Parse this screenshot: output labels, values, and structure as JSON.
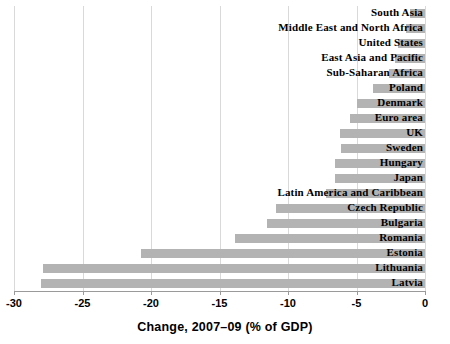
{
  "chart_data": {
    "type": "bar",
    "orientation": "horizontal",
    "title": "",
    "xlabel": "Change, 2007–09 (% of GDP)",
    "ylabel": "",
    "xlim": [
      -30,
      0
    ],
    "xticks": [
      -30,
      -25,
      -20,
      -15,
      -10,
      -5,
      0
    ],
    "xticklabels": [
      "-30",
      "-25",
      "-20",
      "-15",
      "-10",
      "-5",
      "0"
    ],
    "grid": true,
    "legend": null,
    "bar_color": "#b3b3b3",
    "categories": [
      "South Asia",
      "Middle East and North Africa",
      "United States",
      "East Asia and Pacific",
      "Sub-Saharan Africa",
      "Poland",
      "Denmark",
      "Euro area",
      "UK",
      "Sweden",
      "Hungary",
      "Japan",
      "Latin America and Caribbean",
      "Czech Republic",
      "Bulgaria",
      "Romania",
      "Estonia",
      "Lithuania",
      "Latvia"
    ],
    "values": [
      -1.1,
      -1.4,
      -2.0,
      -2.2,
      -2.6,
      -3.8,
      -5.0,
      -5.5,
      -6.2,
      -6.1,
      -6.6,
      -6.6,
      -7.2,
      -10.9,
      -11.5,
      -13.9,
      -20.7,
      -27.9,
      -28.0
    ]
  }
}
